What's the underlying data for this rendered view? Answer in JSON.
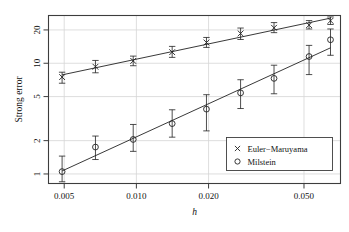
{
  "chart_data": {
    "type": "scatter",
    "title": "",
    "subtitle": "",
    "xlabel": "h",
    "ylabel": "Strong error",
    "xscale": "log",
    "yscale": "log",
    "grid": true,
    "xlim": [
      0.0043,
      0.071
    ],
    "ylim": [
      0.82,
      27
    ],
    "xticks": [
      0.005,
      0.01,
      0.02,
      0.05
    ],
    "xtick_labels": [
      "0.005",
      "0.010",
      "0.020",
      "0.050"
    ],
    "yticks": [
      1,
      2,
      5,
      10,
      20
    ],
    "ytick_labels": [
      "1",
      "2",
      "5",
      "10",
      "20"
    ],
    "legend_position": "bottom-right",
    "errorbars": true,
    "series": [
      {
        "name": "Euler−Maruyama",
        "marker": "x",
        "color": "#222222",
        "x": [
          0.0049,
          0.00675,
          0.0097,
          0.0141,
          0.0196,
          0.0272,
          0.0375,
          0.0525,
          0.0645
        ],
        "values": [
          7.5,
          9.3,
          10.5,
          12.6,
          15.4,
          18.6,
          20.9,
          22.1,
          24.2
        ],
        "err_low": [
          6.6,
          8.2,
          9.5,
          11.3,
          13.9,
          16.4,
          18.9,
          20.4,
          22.4
        ],
        "err_high": [
          8.3,
          10.6,
          11.6,
          14.2,
          17.1,
          20.8,
          23.3,
          24.3,
          26.2
        ],
        "fit_slope": 0.5
      },
      {
        "name": "Milstein",
        "marker": "o",
        "color": "#222222",
        "x": [
          0.0049,
          0.00675,
          0.0097,
          0.0141,
          0.0196,
          0.0272,
          0.0375,
          0.0525,
          0.0645
        ],
        "values": [
          1.05,
          1.75,
          2.05,
          2.85,
          3.85,
          5.4,
          7.3,
          11.5,
          16.3
        ],
        "err_low": [
          0.85,
          1.35,
          1.6,
          2.15,
          2.45,
          3.9,
          5.3,
          7.9,
          11.8
        ],
        "err_high": [
          1.45,
          2.2,
          2.8,
          3.8,
          5.2,
          7.1,
          9.6,
          14.5,
          20.4
        ],
        "fit_slope": 1.0
      }
    ]
  },
  "legend": {
    "entries": [
      {
        "marker": "x",
        "label": "Euler−Maruyama"
      },
      {
        "marker": "o",
        "label": "Milstein"
      }
    ]
  },
  "colors": {
    "frame": "#3d3d3d",
    "grid": "#d6d6d6",
    "series": "#222222",
    "background": "#ffffff"
  }
}
